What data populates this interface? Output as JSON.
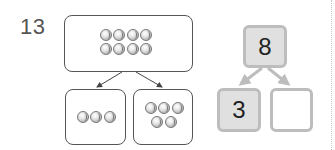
{
  "question": {
    "number": "13"
  },
  "picture_bond": {
    "whole": {
      "count": 8,
      "rows": [
        4,
        4
      ],
      "icon": "baseball-icon"
    },
    "parts": [
      {
        "count": 3,
        "rows": [
          3
        ],
        "icon": "baseball-icon"
      },
      {
        "count": 5,
        "rows": [
          3,
          2
        ],
        "icon": "baseball-icon"
      }
    ]
  },
  "number_bond": {
    "whole": "8",
    "parts": [
      "3",
      ""
    ],
    "colors": {
      "box_border": "#bdbdbd",
      "filled_bg": "#e0e0e0",
      "arrow": "#bdbdbd"
    }
  }
}
